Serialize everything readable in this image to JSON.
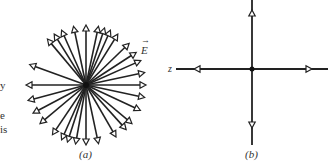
{
  "left_text_fragments": [
    "y",
    "e",
    "is"
  ],
  "figure_a": {
    "caption": "(a)",
    "field_label": "E",
    "center": [
      86,
      85
    ],
    "arrow_angles_deg": [
      0,
      12,
      24,
      33,
      44,
      58,
      66,
      72,
      78,
      90,
      102,
      114,
      122,
      130,
      160,
      180,
      195,
      208,
      220,
      236,
      246,
      252,
      260,
      270,
      282,
      300,
      312,
      320,
      335,
      348
    ],
    "arrow_length": 60
  },
  "figure_b": {
    "caption": "(b)",
    "axis_label": "z",
    "center": [
      252,
      69
    ]
  }
}
